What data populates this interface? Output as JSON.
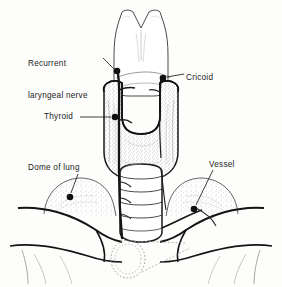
{
  "figure": {
    "name": "thyroid-gland-anatomy-diagram",
    "type": "anatomical-line-drawing",
    "background_color": "#fdfdfb",
    "ink_color": "#1a1a1a",
    "stipple_color": "#8d8d8d"
  },
  "labels": {
    "recurrent_laryngeal_nerve": "Recurrent\nlaryngeal nerve",
    "recurrent_laryngeal_nerve_line1": "Recurrent",
    "recurrent_laryngeal_nerve_line2": "laryngeal nerve",
    "cricoid": "Cricoid",
    "thyroid": "Thyroid",
    "dome_of_lung": "Dome of lung",
    "vessel": "Vessel"
  },
  "structures": [
    {
      "id": "thyroid-cartilage",
      "label": "thyroid cartilage",
      "shaded": false
    },
    {
      "id": "cricoid-cartilage",
      "label": "Cricoid",
      "shaded": false
    },
    {
      "id": "thyroid-gland",
      "label": "Thyroid",
      "shaded": true
    },
    {
      "id": "trachea",
      "label": "trachea",
      "shaded": false
    },
    {
      "id": "recurrent-laryngeal-nerve",
      "label": "Recurrent laryngeal nerve",
      "shaded": false
    },
    {
      "id": "left-dome-of-lung",
      "label": "Dome of lung",
      "shaded": true
    },
    {
      "id": "right-dome-of-lung",
      "label": "Dome of lung",
      "shaded": true
    },
    {
      "id": "vessel",
      "label": "Vessel",
      "shaded": false
    },
    {
      "id": "clavicle-left",
      "label": "clavicle",
      "shaded": false
    },
    {
      "id": "clavicle-right",
      "label": "clavicle",
      "shaded": false
    },
    {
      "id": "hidden-trachea-outline",
      "label": "hidden trachea",
      "shaded": false
    }
  ],
  "leaders": [
    {
      "id": "leader-recurrent-laryngeal-nerve",
      "target_x": 117,
      "target_y": 71
    },
    {
      "id": "leader-cricoid",
      "target_x": 163,
      "target_y": 78
    },
    {
      "id": "leader-thyroid",
      "target_x": 115,
      "target_y": 117
    },
    {
      "id": "leader-dome-of-lung",
      "target_x": 70,
      "target_y": 197
    },
    {
      "id": "leader-vessel",
      "target_x": 194,
      "target_y": 209
    }
  ]
}
